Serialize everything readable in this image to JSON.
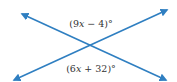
{
  "diagram": {
    "type": "intersecting-lines-vertical-angles",
    "line_color": "#2f7fc1",
    "label_color": "#333333",
    "lines": [
      {
        "name": "line-a",
        "from": [
          22,
          14
        ],
        "to": [
          166,
          80
        ],
        "arrows": "both"
      },
      {
        "name": "line-b",
        "from": [
          14,
          80
        ],
        "to": [
          167,
          10
        ],
        "arrows": "both"
      }
    ],
    "intersection": [
      90,
      46
    ],
    "labels": {
      "top_angle": {
        "open": "(9",
        "var": "x",
        "close": " − 4)°",
        "full": "(9x − 4)°"
      },
      "bottom_angle": {
        "open": "(6",
        "var": "x",
        "close": " + 32)°",
        "full": "(6x + 32)°"
      }
    }
  }
}
